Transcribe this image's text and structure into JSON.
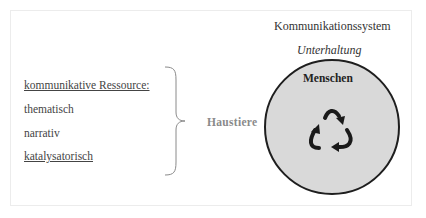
{
  "diagram": {
    "left": {
      "heading": "kommunikative Ressource:",
      "items": [
        "thematisch",
        "narrativ",
        "katalysatorisch"
      ]
    },
    "connector_label": "Haustiere",
    "right": {
      "system_title": "Kommunikationssystem",
      "subtitle": "Unterhaltung",
      "circle_label": "Menschen",
      "circle_icon": "cycle-arrows-icon"
    },
    "colors": {
      "circle_fill": "#d9d9d9",
      "circle_stroke": "#1e1e1e",
      "connector_label": "#8a8a8a"
    }
  }
}
